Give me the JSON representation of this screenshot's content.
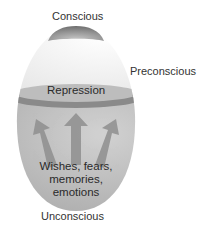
{
  "diagram": {
    "labels": {
      "conscious": "Conscious",
      "preconscious": "Preconscious",
      "repression": "Repression",
      "unconscious": "Unconscious",
      "contents": [
        "Wishes, fears,",
        "memories,",
        "emotions"
      ]
    },
    "arrows": [
      "left-up",
      "up",
      "right-up"
    ],
    "colors": {
      "cap": "#8c8c8c",
      "preconscious_fill": "#f6f6f6",
      "repression_band": "#9a9a9a",
      "repression_band_edge": "#7d7d7d",
      "unconscious_fill": "#b9b9b9",
      "arrow": "#8f8f8f",
      "text": "#333333"
    }
  }
}
